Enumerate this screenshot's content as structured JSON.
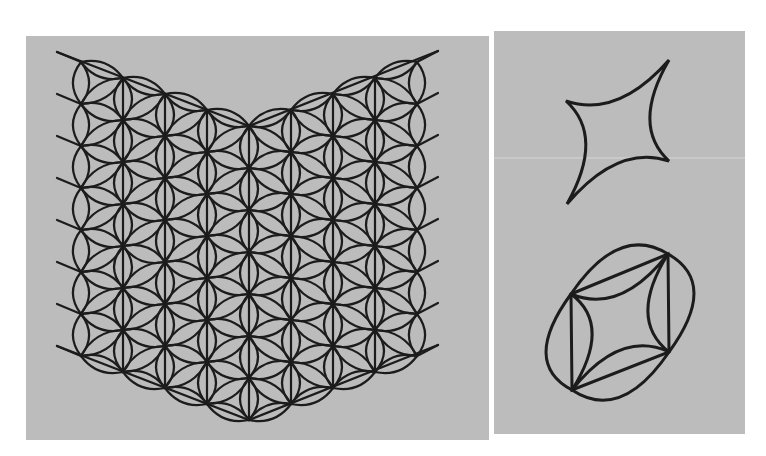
{
  "figure": {
    "background": "#ffffff",
    "panel_fill": "#bcbcbc",
    "stroke_color": "#1c1c1c",
    "panels": [
      {
        "id": "lattice-panel",
        "x": 26,
        "y": 36,
        "width": 463,
        "height": 404
      },
      {
        "id": "curves-panel",
        "x": 494,
        "y": 31,
        "width": 251,
        "height": 403
      }
    ],
    "lattice": {
      "center_x": 249,
      "column_spacing": 42,
      "row_spacing": 42,
      "column_offsets": [
        -4,
        -3,
        -2,
        -1,
        0,
        1,
        2,
        3,
        4
      ],
      "shear_per_column": -16,
      "top_center_y": 126,
      "rows": 8,
      "outer_ray_length": 26,
      "edge_left_x": 83,
      "edge_right_x": 413,
      "ray_left_x": 57,
      "ray_right_x": 438,
      "bottom_vertex": {
        "x": 249,
        "y": 419
      },
      "lens_bulge": 9
    },
    "astroid": {
      "cusps": [
        {
          "name": "top-right",
          "x": 669,
          "y": 60
        },
        {
          "name": "right",
          "x": 669,
          "y": 161
        },
        {
          "name": "bottom-left",
          "x": 567,
          "y": 204
        },
        {
          "name": "left",
          "x": 566,
          "y": 101
        }
      ],
      "center": {
        "x": 618,
        "y": 131
      }
    },
    "inscribed_figure": {
      "vertices": [
        {
          "name": "top-left",
          "x": 571,
          "y": 294
        },
        {
          "name": "top-right",
          "x": 668,
          "y": 254
        },
        {
          "name": "bottom-right",
          "x": 669,
          "y": 352
        },
        {
          "name": "bottom-left",
          "x": 572,
          "y": 390
        }
      ],
      "center": {
        "x": 620,
        "y": 322
      }
    }
  }
}
